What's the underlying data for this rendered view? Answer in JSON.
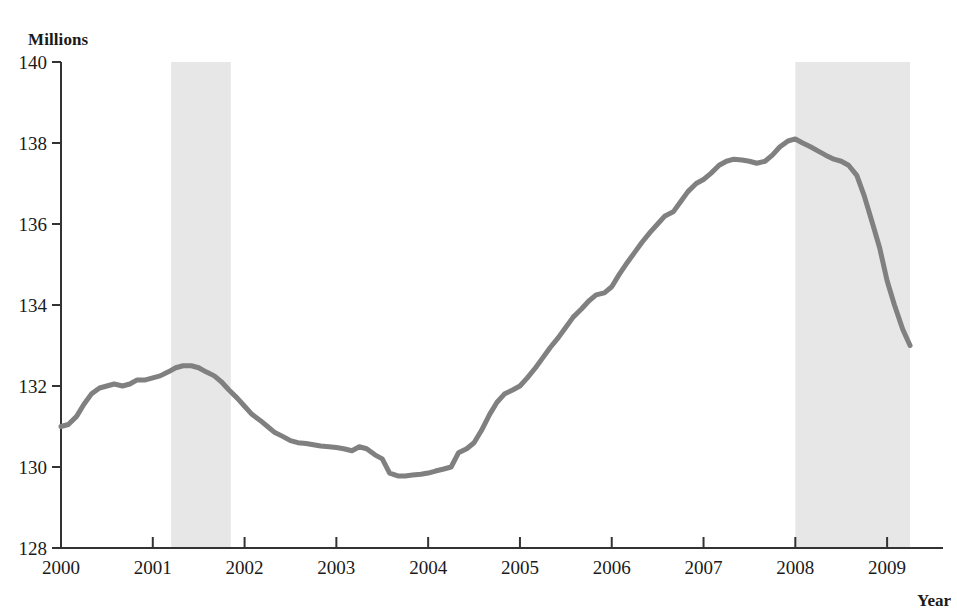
{
  "axis": {
    "y_unit_label": "Millions",
    "x_title": "Year",
    "y_ticks": [
      "128",
      "130",
      "132",
      "134",
      "136",
      "138",
      "140"
    ],
    "x_ticks": [
      "2000",
      "2001",
      "2002",
      "2003",
      "2004",
      "2005",
      "2006",
      "2007",
      "2008",
      "2009"
    ]
  },
  "colors": {
    "line": "#808080",
    "recession_band": "#e7e7e7",
    "axis": "#333333",
    "text": "#1a1a1a",
    "background": "#ffffff"
  },
  "chart_data": {
    "type": "line",
    "title": "",
    "subtitle": "",
    "xlabel": "Year",
    "ylabel": "Millions",
    "xlim": [
      2000.0,
      2009.5
    ],
    "ylim": [
      128,
      140
    ],
    "grid": false,
    "legend_position": "none",
    "y_tick_values": [
      128,
      130,
      132,
      134,
      136,
      138,
      140
    ],
    "x_tick_values": [
      2000,
      2001,
      2002,
      2003,
      2004,
      2005,
      2006,
      2007,
      2008,
      2009
    ],
    "annotations": [
      {
        "type": "shaded-band",
        "label": "recession-band-2001",
        "x_start": 2001.2,
        "x_end": 2001.85
      },
      {
        "type": "shaded-band",
        "label": "recession-band-2008",
        "x_start": 2008.0,
        "x_end": 2009.25
      }
    ],
    "series": [
      {
        "name": "Employment",
        "x": [
          2000.0,
          2000.08,
          2000.17,
          2000.25,
          2000.33,
          2000.42,
          2000.5,
          2000.58,
          2000.67,
          2000.75,
          2000.83,
          2000.92,
          2001.0,
          2001.08,
          2001.17,
          2001.25,
          2001.33,
          2001.42,
          2001.5,
          2001.58,
          2001.67,
          2001.75,
          2001.83,
          2001.92,
          2002.0,
          2002.08,
          2002.17,
          2002.25,
          2002.33,
          2002.42,
          2002.5,
          2002.58,
          2002.67,
          2002.75,
          2002.83,
          2002.92,
          2003.0,
          2003.08,
          2003.17,
          2003.25,
          2003.33,
          2003.42,
          2003.5,
          2003.58,
          2003.67,
          2003.75,
          2003.83,
          2003.92,
          2004.0,
          2004.08,
          2004.17,
          2004.25,
          2004.33,
          2004.42,
          2004.5,
          2004.58,
          2004.67,
          2004.75,
          2004.83,
          2004.92,
          2005.0,
          2005.08,
          2005.17,
          2005.25,
          2005.33,
          2005.42,
          2005.5,
          2005.58,
          2005.67,
          2005.75,
          2005.83,
          2005.92,
          2006.0,
          2006.08,
          2006.17,
          2006.25,
          2006.33,
          2006.42,
          2006.5,
          2006.58,
          2006.67,
          2006.75,
          2006.83,
          2006.92,
          2007.0,
          2007.08,
          2007.17,
          2007.25,
          2007.33,
          2007.42,
          2007.5,
          2007.58,
          2007.67,
          2007.75,
          2007.83,
          2007.92,
          2008.0,
          2008.08,
          2008.17,
          2008.25,
          2008.33,
          2008.42,
          2008.5,
          2008.58,
          2008.67,
          2008.75,
          2008.83,
          2008.92,
          2009.0,
          2009.08,
          2009.17,
          2009.25
        ],
        "values": [
          131.0,
          131.05,
          131.25,
          131.55,
          131.8,
          131.95,
          132.0,
          132.05,
          132.0,
          132.05,
          132.15,
          132.15,
          132.2,
          132.25,
          132.35,
          132.45,
          132.5,
          132.5,
          132.45,
          132.35,
          132.25,
          132.1,
          131.9,
          131.7,
          131.5,
          131.3,
          131.15,
          131.0,
          130.85,
          130.75,
          130.65,
          130.6,
          130.58,
          130.55,
          130.52,
          130.5,
          130.48,
          130.45,
          130.4,
          130.5,
          130.45,
          130.3,
          130.2,
          129.85,
          129.78,
          129.78,
          129.8,
          129.82,
          129.85,
          129.9,
          129.95,
          130.0,
          130.35,
          130.45,
          130.6,
          130.9,
          131.3,
          131.6,
          131.8,
          131.9,
          132.0,
          132.2,
          132.45,
          132.7,
          132.95,
          133.2,
          133.45,
          133.7,
          133.9,
          134.1,
          134.25,
          134.3,
          134.45,
          134.75,
          135.05,
          135.3,
          135.55,
          135.8,
          136.0,
          136.2,
          136.3,
          136.55,
          136.8,
          137.0,
          137.1,
          137.25,
          137.45,
          137.55,
          137.6,
          137.58,
          137.55,
          137.5,
          137.55,
          137.7,
          137.9,
          138.05,
          138.1,
          138.0,
          137.9,
          137.8,
          137.7,
          137.6,
          137.55,
          137.45,
          137.2,
          136.7,
          136.1,
          135.4,
          134.6,
          134.0,
          133.4,
          133.0
        ]
      }
    ]
  }
}
